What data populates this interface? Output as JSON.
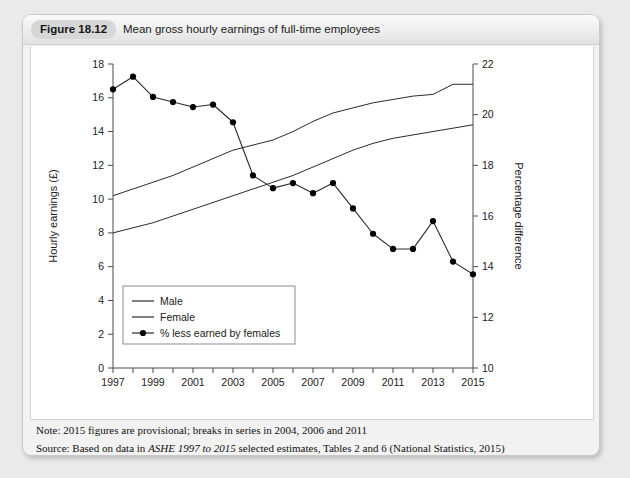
{
  "figure": {
    "badge": "Figure 18.12",
    "title": "Mean gross hourly earnings of full-time employees"
  },
  "notes": {
    "note_label": "Note: ",
    "note_text": "2015 figures are provisional; breaks in series in 2004, 2006 and 2011",
    "source_label": "Source: ",
    "source_pre": "Based on data in ",
    "source_italic": "ASHE 1997 to 2015",
    "source_post": " selected estimates, Tables 2 and 6 (National Statistics, 2015)"
  },
  "legend": {
    "male": "Male",
    "female": "Female",
    "pct": "% less earned by females"
  },
  "colors": {
    "line": "#2b2b2b",
    "marker": "#000000",
    "panel": "#ffffff",
    "page": "#eaeaea",
    "badge": "#d7d7d7"
  },
  "chart_data": {
    "type": "line",
    "title": "Mean gross hourly earnings of full-time employees",
    "xlabel": "",
    "ylabel": "Hourly earnings (£)",
    "y2label": "Percentage difference",
    "xlim": [
      1997,
      2015
    ],
    "ylim": [
      0,
      18
    ],
    "y2lim": [
      10,
      22
    ],
    "yticks": [
      0,
      2,
      4,
      6,
      8,
      10,
      12,
      14,
      16,
      18
    ],
    "y2ticks": [
      10,
      12,
      14,
      16,
      18,
      20,
      22
    ],
    "x": [
      1997,
      1998,
      1999,
      2000,
      2001,
      2002,
      2003,
      2004,
      2005,
      2006,
      2007,
      2008,
      2009,
      2010,
      2011,
      2012,
      2013,
      2014,
      2015
    ],
    "xtick_labels": [
      "1997",
      "1999",
      "2001",
      "2003",
      "2005",
      "2007",
      "2009",
      "2011",
      "2013",
      "2015"
    ],
    "grid": false,
    "legend_position": "lower left",
    "series": [
      {
        "name": "Male",
        "axis": "left",
        "marker": "none",
        "values": [
          10.2,
          10.6,
          11.0,
          11.4,
          11.9,
          12.4,
          12.9,
          13.2,
          13.5,
          14.0,
          14.6,
          15.1,
          15.4,
          15.7,
          15.9,
          16.1,
          16.2,
          16.8,
          16.8
        ]
      },
      {
        "name": "Female",
        "axis": "left",
        "marker": "none",
        "values": [
          8.0,
          8.3,
          8.6,
          9.0,
          9.4,
          9.8,
          10.2,
          10.6,
          11.0,
          11.4,
          11.9,
          12.4,
          12.9,
          13.3,
          13.6,
          13.8,
          14.0,
          14.2,
          14.4
        ]
      },
      {
        "name": "% less earned by females",
        "axis": "right",
        "marker": "circle",
        "values": [
          21.0,
          21.5,
          20.7,
          20.5,
          20.3,
          20.4,
          19.7,
          17.6,
          17.1,
          17.3,
          16.9,
          17.3,
          16.3,
          15.3,
          14.7,
          14.7,
          15.8,
          14.2,
          13.7
        ]
      }
    ]
  }
}
